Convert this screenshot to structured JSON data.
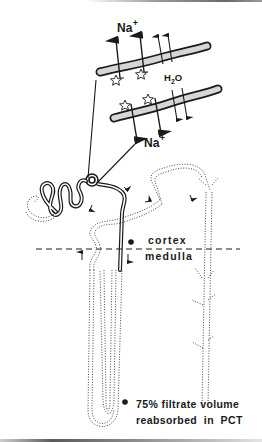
{
  "figure": {
    "labels": {
      "na_top": {
        "base": "Na",
        "charge": "+"
      },
      "na_bottom": {
        "base": "Na",
        "charge": "+"
      },
      "water": {
        "pre": "H",
        "sub": "2",
        "post": "O"
      },
      "cortex": "cortex",
      "medulla": "medulla"
    },
    "footnote": {
      "marker": "✱",
      "line1": "75% filtrate volume",
      "line2": "reabsorbed  in  PCT"
    },
    "colors": {
      "ink": "#1a1a1a",
      "membrane_fill": "#d6d6d6",
      "background": "#ffffff"
    }
  }
}
